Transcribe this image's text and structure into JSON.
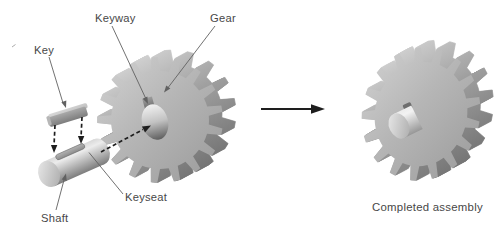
{
  "figure": {
    "labels": {
      "key": "Key",
      "keyway": "Keyway",
      "gear": "Gear",
      "keyseat": "Keyseat",
      "shaft": "Shaft",
      "completed_assembly": "Completed assembly"
    },
    "parts": {
      "gear_teeth": 17
    },
    "colors": {
      "background": "#ffffff",
      "label_text": "#474747",
      "leader_line": "#616161",
      "arrow_ink": "#1e1e1e",
      "gear_face_light": "#d3d3d3",
      "gear_face_dark": "#9a9a9a",
      "gear_side_light": "#d8d8d8",
      "gear_side_mid": "#a0a0a0",
      "gear_side_dark": "#6c6c6c",
      "hole_light": "#f1f1f1",
      "hole_dark": "#5f5f5f",
      "metal_highlight": "#ececec",
      "metal_light": "#d9d9d9",
      "metal_mid": "#a9a9a9",
      "metal_dark": "#7d7d7d",
      "notch_shadow": "#6e6e6e"
    }
  }
}
